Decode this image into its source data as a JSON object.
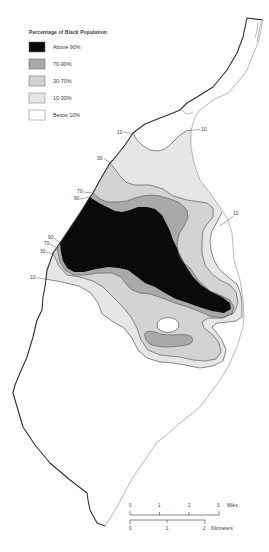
{
  "legend": {
    "title": "Percentage of Black Population",
    "items": [
      {
        "label": "Above 90%",
        "color": "#0a0a0a"
      },
      {
        "label": "70-90%",
        "color": "#a9a9a9"
      },
      {
        "label": "30-70%",
        "color": "#d3d3d3"
      },
      {
        "label": "10-30%",
        "color": "#e6e6e6"
      },
      {
        "label": "Below 10%",
        "color": "#ffffff"
      }
    ]
  },
  "contour_labels": [
    {
      "text": "10"
    },
    {
      "text": "10"
    },
    {
      "text": "30"
    },
    {
      "text": "70"
    },
    {
      "text": "90"
    },
    {
      "text": "90"
    },
    {
      "text": "70"
    },
    {
      "text": "30"
    },
    {
      "text": "10"
    },
    {
      "text": "10"
    }
  ],
  "scale_bar": {
    "miles": {
      "ticks": [
        "0",
        "1",
        "2",
        "3"
      ],
      "unit": "Miles"
    },
    "kilometers": {
      "ticks": [
        "0",
        "1",
        "2"
      ],
      "unit": "Kilometers"
    }
  },
  "colors": {
    "above_90": "#0a0a0a",
    "band_70_90": "#a9a9a9",
    "band_30_70": "#d3d3d3",
    "band_10_30": "#e6e6e6",
    "below_10": "#ffffff",
    "river_line": "#2e2e2e",
    "land_edge": "#9a9a9a",
    "contour_line": "#6b6b6b"
  }
}
